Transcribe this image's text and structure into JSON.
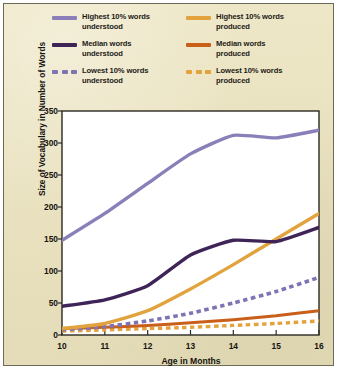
{
  "legend": {
    "items": [
      {
        "label_line1": "Highest 10% words",
        "label_line2": "understood",
        "color": "#8a7fb8",
        "style": "solid",
        "name": "highest-understood"
      },
      {
        "label_line1": "Highest 10% words",
        "label_line2": "produced",
        "color": "#e2a33e",
        "style": "solid",
        "name": "highest-produced"
      },
      {
        "label_line1": "Median words",
        "label_line2": "understood",
        "color": "#3f2457",
        "style": "solid",
        "name": "median-understood"
      },
      {
        "label_line1": "Median words",
        "label_line2": "produced",
        "color": "#c95f18",
        "style": "solid",
        "name": "median-produced"
      },
      {
        "label_line1": "Lowest 10% words",
        "label_line2": "understood",
        "color": "#7d74b4",
        "style": "dashed",
        "name": "lowest-understood"
      },
      {
        "label_line1": "Lowest 10% words",
        "label_line2": "produced",
        "color": "#e2a33e",
        "style": "dashed",
        "name": "lowest-produced"
      }
    ]
  },
  "chart_data": {
    "type": "line",
    "title": "",
    "xlabel": "Age in Months",
    "ylabel": "Size of Vocabulary in Number of Words",
    "x": [
      10,
      11,
      12,
      13,
      14,
      15,
      16
    ],
    "xlim": [
      10,
      16
    ],
    "ylim": [
      0,
      350
    ],
    "xticks": [
      10,
      11,
      12,
      13,
      14,
      15,
      16
    ],
    "yticks": [
      0,
      50,
      100,
      150,
      200,
      250,
      300,
      350
    ],
    "grid": false,
    "legend_position": "top",
    "series": [
      {
        "name": "Highest 10% words understood",
        "color": "#8a7fb8",
        "style": "solid",
        "width": 3.4,
        "values": [
          148,
          190,
          237,
          283,
          312,
          308,
          320
        ]
      },
      {
        "name": "Median words understood",
        "color": "#3f2457",
        "style": "solid",
        "width": 3.4,
        "values": [
          45,
          55,
          77,
          125,
          148,
          146,
          168
        ]
      },
      {
        "name": "Lowest 10% words understood",
        "color": "#7d74b4",
        "style": "dashed",
        "width": 3.6,
        "values": [
          8,
          13,
          22,
          34,
          50,
          68,
          90
        ]
      },
      {
        "name": "Highest 10% words produced",
        "color": "#e2a33e",
        "style": "solid",
        "width": 3.4,
        "values": [
          10,
          18,
          38,
          72,
          110,
          150,
          190
        ]
      },
      {
        "name": "Median words produced",
        "color": "#c95f18",
        "style": "solid",
        "width": 3.0,
        "values": [
          10,
          12,
          15,
          19,
          24,
          30,
          38
        ]
      },
      {
        "name": "Lowest 10% words produced",
        "color": "#e2a33e",
        "style": "dashed",
        "width": 3.4,
        "values": [
          6,
          8,
          10,
          12,
          15,
          18,
          22
        ]
      }
    ]
  }
}
